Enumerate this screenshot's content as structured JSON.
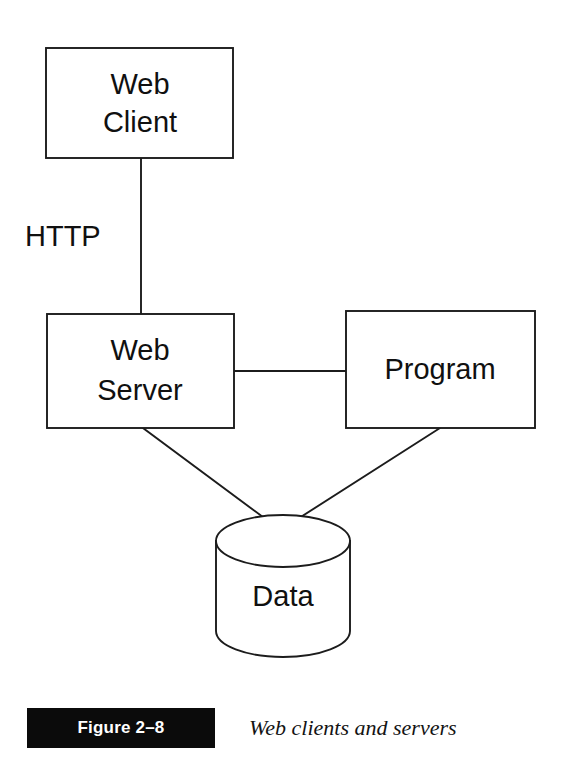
{
  "figure": {
    "title": "Web clients and servers",
    "badge_label": "Figure 2–8",
    "background_color": "#ffffff",
    "line_color": "#1c1c1c",
    "text_color": "#101010",
    "badge_background": "#0b0b0b",
    "badge_text_color": "#ffffff"
  },
  "nodes": {
    "web_client": {
      "label_line1": "Web",
      "label_line2": "Client",
      "shape": "rectangle"
    },
    "web_server": {
      "label_line1": "Web",
      "label_line2": "Server",
      "shape": "rectangle"
    },
    "program": {
      "label_line1": "Program",
      "shape": "rectangle"
    },
    "data_store": {
      "label_line1": "Data",
      "shape": "cylinder"
    }
  },
  "edges": {
    "client_to_server": {
      "label": "HTTP",
      "style": "vertical-line"
    },
    "server_to_program": {
      "label": "",
      "style": "horizontal-line"
    },
    "server_to_data": {
      "label": "",
      "style": "diagonal-line"
    },
    "program_to_data": {
      "label": "",
      "style": "diagonal-line"
    }
  }
}
